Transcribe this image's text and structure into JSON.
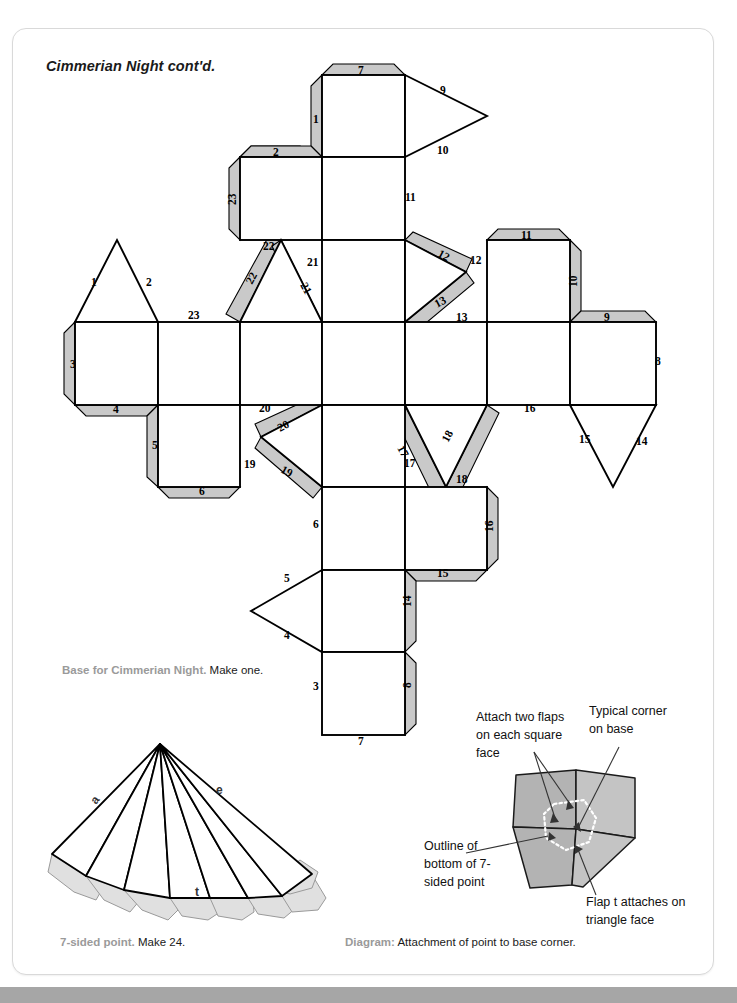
{
  "page": {
    "title": "Cimmerian Night cont'd.",
    "bottom_bar_color": "#a6a6a6",
    "tab_color": "#c9c9c9"
  },
  "captions": {
    "base_bold": "Base for Cimmerian Night.",
    "base_rest": " Make one.",
    "point_bold": "7-sided point.",
    "point_rest": " Make 24.",
    "diagram_bold": "Diagram:",
    "diagram_rest": " Attachment of point to base corner."
  },
  "net": {
    "name": "base-net-diagram",
    "grid_labels": [
      "7",
      "1",
      "9",
      "10",
      "2",
      "23",
      "11",
      "22",
      "21",
      "22",
      "21",
      "12",
      "12",
      "11",
      "10",
      "1",
      "2",
      "23",
      "13",
      "13",
      "9",
      "3",
      "8",
      "4",
      "20",
      "20",
      "16",
      "15",
      "14",
      "5",
      "19",
      "19",
      "17",
      "18",
      "17",
      "18",
      "6",
      "16",
      "6",
      "15",
      "5",
      "14",
      "4",
      "3",
      "8",
      "7"
    ],
    "edge_numbers_top": [
      "7",
      "1",
      "9",
      "10"
    ],
    "edge_numbers_left": [
      "1",
      "2",
      "23",
      "3",
      "4",
      "5",
      "6",
      "19",
      "20",
      "22",
      "21"
    ],
    "edge_numbers_right": [
      "11",
      "12",
      "13",
      "9",
      "10",
      "8",
      "14",
      "15",
      "16",
      "18",
      "17"
    ],
    "edge_numbers_bottom": [
      "3",
      "4",
      "5",
      "6",
      "7",
      "8",
      "14",
      "15"
    ]
  },
  "fan": {
    "name": "seven-sided-point",
    "labels": [
      "a",
      "e",
      "t"
    ]
  },
  "attach_diagram": {
    "annotations": [
      {
        "id": "attach-two-flaps",
        "lines": [
          "Attach two flaps",
          "on each square",
          "face"
        ]
      },
      {
        "id": "typical-corner",
        "lines": [
          "Typical corner",
          "on base"
        ]
      },
      {
        "id": "outline-bottom",
        "lines": [
          "Outline of",
          "bottom of 7-",
          "sided point"
        ]
      },
      {
        "id": "flap-t",
        "lines": [
          "Flap t attaches on",
          "triangle face"
        ]
      }
    ]
  }
}
